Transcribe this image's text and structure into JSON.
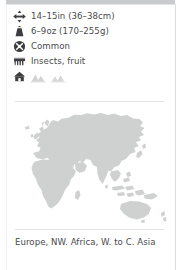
{
  "card": {
    "type": "species-fact-card",
    "accent_color": "#4a4a4c",
    "map_land_color": "#cfd0d0",
    "rule_color": "#c9cbcc"
  },
  "facts": [
    {
      "icon": "length-arrows-icon",
      "label": "length",
      "value": "14–15in (36–38cm)"
    },
    {
      "icon": "weight-scale-icon",
      "label": "weight",
      "value": "6–9oz (170–255g)"
    },
    {
      "icon": "conservation-status-icon",
      "label": "status",
      "value": "Common"
    },
    {
      "icon": "diet-icon",
      "label": "diet",
      "value": "Insects, fruit"
    }
  ],
  "habitat": {
    "icon": "habitat-house-icon",
    "label": "habitat",
    "glyphs": [
      {
        "icon": "habitat-house-icon",
        "active": true
      },
      {
        "icon": "habitat-hills-icon",
        "active": false
      },
      {
        "icon": "habitat-mountains-icon",
        "active": false
      }
    ]
  },
  "map": {
    "name": "distribution-map",
    "regions": [
      "Europe",
      "Africa",
      "Asia",
      "Australia"
    ]
  },
  "caption": {
    "text": "Europe, NW. Africa, W. to C. Asia"
  }
}
